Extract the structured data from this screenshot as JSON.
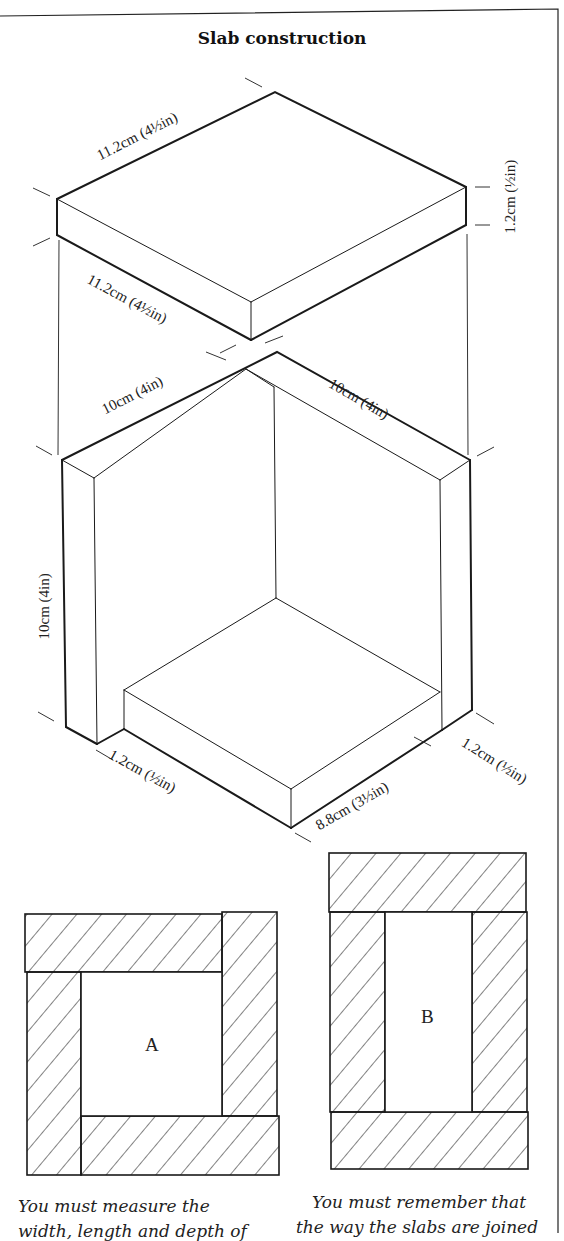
{
  "title": "Slab construction",
  "dimensions": {
    "top_slab_length_back": "11.2cm (4½in)",
    "top_slab_length_front": "11.2cm (4½in)",
    "top_slab_thickness": "1.2cm (½in)",
    "box_left_top_edge": "10cm (4in)",
    "box_right_top_edge": "10cm (4in)",
    "box_height": "10cm (4in)",
    "base_wall_thickness_left": "1.2cm (½in)",
    "base_slab_width": "8.8cm (3½in)",
    "base_wall_thickness_right": "1.2cm (½in)"
  },
  "plans": [
    {
      "id": "A",
      "label": "A"
    },
    {
      "id": "B",
      "label": "B"
    }
  ],
  "captions": {
    "left": "You must measure the",
    "left_cut": "width, length and depth of",
    "right": "You must remember that",
    "right_cut": "the way the slabs are joined"
  },
  "colors": {
    "line": "#1a1a1a",
    "background": "#ffffff"
  }
}
